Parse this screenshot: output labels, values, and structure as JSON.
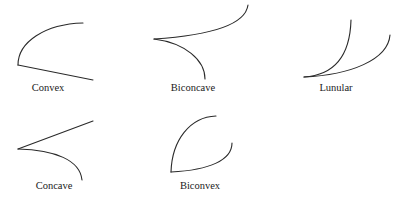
{
  "diagram": {
    "title": "",
    "stroke_color": "#2a2a2a",
    "background": "#ffffff",
    "shapes": [
      {
        "name": "Convex",
        "label": "Convex",
        "label_pos": {
          "x": 48,
          "y": 83
        },
        "paths": [
          "M18,65 C18,42 45,24 83,23",
          "M18,65 L93,80"
        ]
      },
      {
        "name": "Biconcave",
        "label": "Biconcave",
        "label_pos": {
          "x": 193,
          "y": 83
        },
        "paths": [
          "M154,39 C200,36 245,28 248,5",
          "M154,39 C185,43 205,60 205,79"
        ]
      },
      {
        "name": "Lunular",
        "label": "Lunular",
        "label_pos": {
          "x": 336,
          "y": 83
        },
        "paths": [
          "M304,77 C335,75 350,55 351,20",
          "M304,77 C350,75 388,60 390,35"
        ]
      },
      {
        "name": "Concave",
        "label": "Concave",
        "label_pos": {
          "x": 54,
          "y": 181
        },
        "paths": [
          "M18,149 L93,121",
          "M18,149 C55,150 80,160 82,180"
        ]
      },
      {
        "name": "Biconvex",
        "label": "Biconvex",
        "label_pos": {
          "x": 200,
          "y": 181
        },
        "paths": [
          "M171,172 C172,140 190,117 216,116",
          "M171,172 C210,170 232,160 232,143"
        ]
      }
    ]
  }
}
